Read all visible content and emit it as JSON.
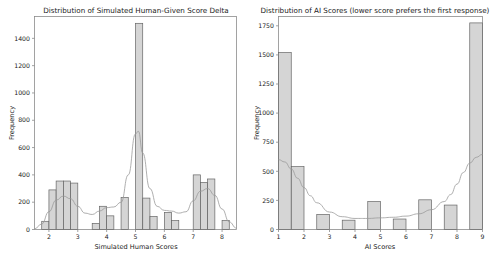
{
  "figure": {
    "width": 499,
    "height": 263,
    "background": "#ffffff",
    "bar_fill": "#cccccc",
    "bar_edge": "#666666",
    "kde_color": "#9a9a9a"
  },
  "chart_data": [
    {
      "id": "left",
      "type": "bar",
      "title": "Distribution of Simulated Human-Given Score Delta",
      "xlabel": "Simulated Human Scores",
      "ylabel": "Frequency",
      "xlim": [
        1.5,
        8.5
      ],
      "ylim": [
        0,
        1560
      ],
      "grid": false,
      "legend": "none",
      "xticks": [
        2,
        3,
        4,
        5,
        6,
        7,
        8
      ],
      "xticklabels": [
        "2",
        "3",
        "4",
        "5",
        "6",
        "7",
        "8"
      ],
      "yticks": [
        0,
        200,
        400,
        600,
        800,
        1000,
        1200,
        1400
      ],
      "yticklabels": [
        "0",
        "200",
        "400",
        "600",
        "800",
        "1000",
        "1200",
        "1400"
      ],
      "bin_width": 0.25,
      "bins": [
        1.75,
        2.0,
        2.25,
        2.5,
        2.75,
        3.5,
        3.75,
        4.0,
        4.5,
        5.0,
        5.25,
        5.5,
        6.0,
        6.25,
        7.0,
        7.25,
        7.5,
        8.0
      ],
      "values": [
        60,
        290,
        355,
        355,
        340,
        45,
        170,
        100,
        235,
        1510,
        230,
        95,
        125,
        65,
        400,
        345,
        370,
        65
      ],
      "kde": {
        "label": "density",
        "x": [
          1.5,
          1.75,
          2.0,
          2.25,
          2.5,
          2.75,
          3.0,
          3.25,
          3.5,
          3.75,
          4.0,
          4.25,
          4.5,
          4.75,
          5.0,
          5.1,
          5.25,
          5.5,
          5.75,
          6.0,
          6.25,
          6.5,
          6.75,
          7.0,
          7.25,
          7.5,
          7.75,
          8.0,
          8.25,
          8.5
        ],
        "y": [
          5,
          40,
          130,
          215,
          245,
          225,
          170,
          120,
          110,
          135,
          160,
          165,
          200,
          400,
          700,
          720,
          560,
          300,
          170,
          140,
          135,
          120,
          130,
          210,
          280,
          300,
          250,
          150,
          55,
          10
        ]
      }
    },
    {
      "id": "right",
      "type": "bar",
      "title": "Distribution of AI Scores (lower score prefers the first response)",
      "xlabel": "AI Scores",
      "ylabel": "Frequency",
      "xlim": [
        1,
        9
      ],
      "ylim": [
        0,
        1830
      ],
      "grid": false,
      "legend": "none",
      "xticks": [
        1,
        2,
        3,
        4,
        5,
        6,
        7,
        8,
        9
      ],
      "xticklabels": [
        "1",
        "2",
        "3",
        "4",
        "5",
        "6",
        "7",
        "8",
        "9"
      ],
      "yticks": [
        0,
        250,
        500,
        750,
        1000,
        1250,
        1500,
        1750
      ],
      "yticklabels": [
        "0",
        "250",
        "500",
        "750",
        "1000",
        "1250",
        "1500",
        "1750"
      ],
      "bin_width": 0.5,
      "bins": [
        1.0,
        1.5,
        2.5,
        3.5,
        4.5,
        5.5,
        6.5,
        7.5,
        8.5
      ],
      "values": [
        1520,
        540,
        130,
        80,
        240,
        90,
        255,
        210,
        1775
      ],
      "kde": {
        "label": "density",
        "x": [
          1.0,
          1.25,
          1.5,
          1.75,
          2.0,
          2.25,
          2.5,
          3.0,
          3.5,
          4.0,
          4.5,
          5.0,
          5.5,
          6.0,
          6.5,
          7.0,
          7.5,
          7.75,
          8.0,
          8.25,
          8.5,
          8.75,
          9.0
        ],
        "y": [
          600,
          580,
          520,
          440,
          360,
          290,
          230,
          150,
          110,
          95,
          95,
          100,
          105,
          115,
          135,
          170,
          240,
          300,
          390,
          490,
          570,
          620,
          645
        ]
      }
    }
  ]
}
